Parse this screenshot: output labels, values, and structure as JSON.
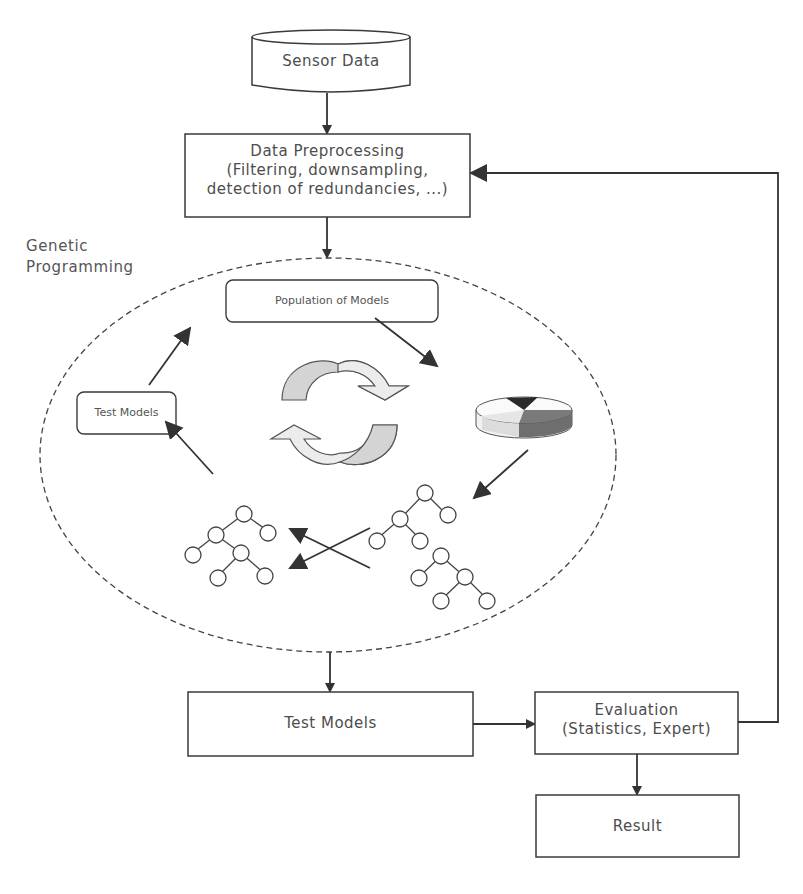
{
  "diagram": {
    "nodes": {
      "sensor_data": {
        "label": "Sensor Data",
        "shape": "cylinder"
      },
      "preprocessing": {
        "title": "Data Preprocessing",
        "line2": "(Filtering, downsampling,",
        "line3": "detection of redundancies, ...)"
      },
      "gp_region": {
        "label_line1": "Genetic",
        "label_line2": "Programming",
        "shape": "dashed-ellipse"
      },
      "population": {
        "label": "Population of Models"
      },
      "inner_test_models": {
        "label": "Test Models"
      },
      "test_models": {
        "label": "Test Models"
      },
      "evaluation": {
        "title": "Evaluation",
        "subtitle": "(Statistics, Expert)"
      },
      "result": {
        "label": "Result"
      }
    },
    "icons": {
      "cycle": "cycle-arrows-icon",
      "selection": "pie-chart-icon",
      "crossover": "crossover-arrows-icon",
      "trees": "expression-tree-icon"
    },
    "tree_symbols": {
      "left_tree": [
        "-",
        "+",
        "x",
        "x",
        "*",
        "x",
        "x"
      ],
      "right_tree_top": [
        "-",
        "+",
        "x",
        "x",
        "x"
      ],
      "right_tree_bottom": [
        "*",
        "x",
        "*",
        "x",
        "y"
      ]
    },
    "edges": [
      {
        "from": "Sensor Data",
        "to": "Data Preprocessing"
      },
      {
        "from": "Data Preprocessing",
        "to": "Genetic Programming"
      },
      {
        "from": "Population of Models",
        "to": "Selection"
      },
      {
        "from": "Selection",
        "to": "Crossover trees"
      },
      {
        "from": "Crossover trees",
        "to": "Test Models (inner)"
      },
      {
        "from": "Test Models (inner)",
        "to": "Population of Models"
      },
      {
        "from": "Genetic Programming",
        "to": "Test Models"
      },
      {
        "from": "Test Models",
        "to": "Evaluation"
      },
      {
        "from": "Evaluation",
        "to": "Result"
      },
      {
        "from": "Evaluation",
        "to": "Data Preprocessing",
        "type": "feedback"
      }
    ],
    "colors": {
      "stroke": "#3a3a3a",
      "text": "#4d4d4d",
      "arrow_light": "#e6e6e6",
      "arrow_mid": "#c8c8c8",
      "pie_dark": "#6e6e6e",
      "pie_black": "#2a2a2a",
      "pie_light": "#dcdcdc"
    }
  }
}
